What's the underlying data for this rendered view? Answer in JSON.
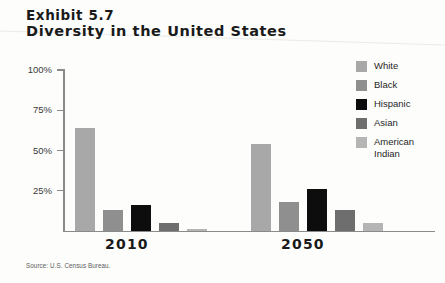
{
  "title": {
    "exhibit": "Exhibit 5.7",
    "name": "Diversity in the United States"
  },
  "source": "Source: U.S. Census Bureau.",
  "legend": {
    "position": "right",
    "items": [
      {
        "label": "White",
        "color": "#a8a8a8"
      },
      {
        "label": "Black",
        "color": "#8f8f8f"
      },
      {
        "label": "Hispanic",
        "color": "#0d0d0d"
      },
      {
        "label": "Asian",
        "color": "#6e6e6e"
      },
      {
        "label": "American Indian",
        "color": "#b5b5b5"
      }
    ]
  },
  "axis": {
    "y_ticks": [
      "100%",
      "75%",
      "50%",
      "25%"
    ],
    "axis_color": "#8a8a8a"
  },
  "chart_data": {
    "type": "bar",
    "title": "Diversity in the United States",
    "subtitle": "Exhibit 5.7",
    "xlabel": "",
    "ylabel": "",
    "ylim": [
      0,
      100
    ],
    "yticks": [
      25,
      50,
      75,
      100
    ],
    "ytick_labels": [
      "25%",
      "50%",
      "75%",
      "100%"
    ],
    "grid": false,
    "legend_position": "right",
    "categories": [
      "2010",
      "2050"
    ],
    "series": [
      {
        "name": "White",
        "color": "#a8a8a8",
        "values": [
          64,
          54
        ]
      },
      {
        "name": "Black",
        "color": "#8f8f8f",
        "values": [
          13,
          18
        ]
      },
      {
        "name": "Hispanic",
        "color": "#0d0d0d",
        "values": [
          16,
          26
        ]
      },
      {
        "name": "Asian",
        "color": "#6e6e6e",
        "values": [
          5,
          13
        ]
      },
      {
        "name": "American Indian",
        "color": "#b5b5b5",
        "values": [
          1.5,
          5
        ]
      }
    ],
    "source": "Source: U.S. Census Bureau."
  }
}
